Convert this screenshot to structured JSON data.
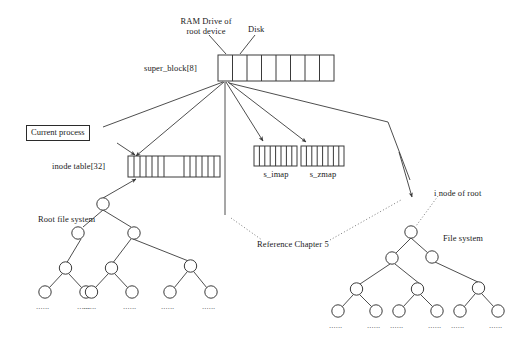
{
  "diagram": {
    "title_labels": {
      "ram_drive": "RAM Drive of\nroot device",
      "ram_drive_line1": "RAM Drive of",
      "ram_drive_line2": "root device",
      "disk": "Disk"
    },
    "arrays": [
      {
        "id": "super-block",
        "label": "super_block[8]",
        "cells": 8
      },
      {
        "id": "inode-table",
        "label": "inode table[32]",
        "cells_left": 6,
        "cells_right": 7,
        "total": 32
      },
      {
        "id": "s-imap",
        "label": "s_imap",
        "cells": 8
      },
      {
        "id": "s-zmap",
        "label": "s_zmap",
        "cells": 8
      }
    ],
    "callouts": [
      {
        "id": "current-process",
        "label": "Current process",
        "boxed": true
      },
      {
        "id": "root-file-system",
        "label": "Root file system",
        "boxed": false
      },
      {
        "id": "file-system",
        "label": "File system",
        "boxed": false
      },
      {
        "id": "inode-of-root",
        "label": "i node of root",
        "boxed": false
      },
      {
        "id": "reference-chapter",
        "label": "Reference Chapter 5",
        "boxed": false
      }
    ],
    "trees": [
      {
        "id": "root-file-system-tree",
        "name": "Root file system",
        "leaf_ellipsis": "......",
        "leaf_count": 6
      },
      {
        "id": "file-system-tree",
        "name": "File system",
        "leaf_ellipsis": "......",
        "leaf_count": 6
      }
    ],
    "colors": {
      "stroke": "#3a3a3a",
      "text": "#1a1a1a",
      "background": "#ffffff",
      "dotted": "#6b6b6b"
    },
    "ellipsis": "......"
  }
}
